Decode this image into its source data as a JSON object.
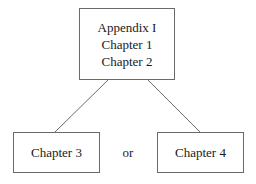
{
  "diagram": {
    "top_box": {
      "lines": [
        "Appendix I",
        "Chapter 1",
        "Chapter 2"
      ]
    },
    "left_box": {
      "label": "Chapter 3"
    },
    "right_box": {
      "label": "Chapter 4"
    },
    "connector_label": "or"
  }
}
